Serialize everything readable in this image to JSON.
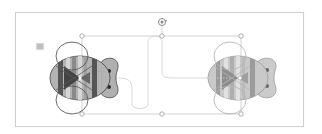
{
  "canvas": {
    "frame_color": "#cfcfcf",
    "background": "#ffffff"
  },
  "marker": {
    "icon": "small-square-marker",
    "color": "#bdbdbd"
  },
  "selection": {
    "x": 82,
    "y": 36,
    "width": 159,
    "height": 78,
    "stroke": "#c8c8c8",
    "handles": [
      "top-left",
      "top-center",
      "top-right",
      "bottom-left",
      "bottom-center",
      "bottom-right"
    ],
    "rotate_handle_icon": "rotate-icon"
  },
  "shapes": {
    "bees": [
      {
        "name": "bee-left",
        "cx": 82,
        "cy": 78,
        "emphasis": "dark"
      },
      {
        "name": "bee-right",
        "cx": 242,
        "cy": 78,
        "emphasis": "light"
      }
    ],
    "motion_path": {
      "name": "motion-path",
      "stroke": "#d9d9d9"
    }
  },
  "colors": {
    "body_fill": "#b3b3b3",
    "stripe_dark": "#555555",
    "stripe_mid": "#8a8a8a",
    "stripe_light": "#d6d6d6",
    "wing_stroke_dark": "#5a5a5a",
    "wing_stroke_light": "#a9a9a9",
    "eye": "#2a2a2a"
  }
}
